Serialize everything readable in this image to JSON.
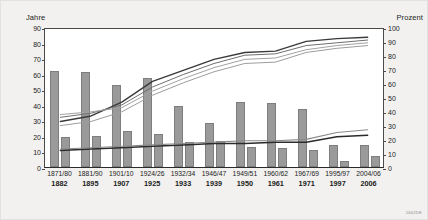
{
  "figure": {
    "background": "#f2f1ef",
    "plot_background": "#ffffff",
    "source_code": "1662DE"
  },
  "axes": {
    "left_caption": "Jahre",
    "right_caption": "Prozent",
    "left_ticks": [
      "90",
      "80",
      "70",
      "60",
      "50",
      "40",
      "30",
      "20",
      "10",
      "0"
    ],
    "right_ticks": [
      "100",
      "90",
      "80",
      "70",
      "60",
      "50",
      "40",
      "30",
      "20",
      "10",
      "0"
    ],
    "left_range": [
      0,
      90
    ],
    "right_range": [
      0,
      100
    ]
  },
  "chart_data": {
    "type": "bar",
    "title": "",
    "subtitle": "",
    "xlabel": "",
    "ylabel": "Jahre",
    "y2label": "Prozent",
    "ylim": [
      0,
      90
    ],
    "y2lim": [
      0,
      100
    ],
    "grid": false,
    "legend": "none",
    "categories": [
      "1871/80\n1882",
      "1881/90\n1895",
      "1901/10\n1907",
      "1924/26\n1925",
      "1932/34\n1933",
      "1946/47\n1939",
      "1949/51\n1950",
      "1960/62\n1961",
      "1967/69\n1971",
      "1995/97\n1997",
      "2004/06\n2006"
    ],
    "category_periods": [
      "1871/80",
      "1881/90",
      "1901/10",
      "1924/26",
      "1932/34",
      "1946/47",
      "1949/51",
      "1960/62",
      "1967/69",
      "1995/97",
      "2004/06"
    ],
    "category_years": [
      "1882",
      "1895",
      "1907",
      "1925",
      "1933",
      "1939",
      "1950",
      "1961",
      "1971",
      "1997",
      "2006"
    ],
    "bar_series": [
      {
        "name": "Saeule A (Jahre)",
        "axis": "left",
        "color": "#9a9a9a",
        "values": [
          62,
          61,
          53,
          57,
          39,
          28,
          42,
          41,
          37,
          14,
          14
        ]
      },
      {
        "name": "Saeule B (Jahre)",
        "axis": "left",
        "color": "#9a9a9a",
        "values": [
          19,
          20,
          23,
          21,
          16,
          17,
          13,
          12,
          11,
          4,
          7
        ]
      }
    ],
    "line_series": [
      {
        "name": "Linie 1 (Prozent)",
        "axis": "right",
        "color": "#3a3a3a",
        "width": 1.4,
        "values": [
          33,
          37,
          47,
          62,
          70,
          78,
          83,
          84,
          91,
          93,
          94
        ]
      },
      {
        "name": "Linie 2 (Prozent)",
        "axis": "right",
        "color": "#6f6f6f",
        "width": 1.0,
        "values": [
          36,
          39,
          45,
          58,
          67,
          75,
          81,
          82,
          88,
          90,
          92
        ]
      },
      {
        "name": "Linie 3 (Prozent)",
        "axis": "right",
        "color": "#a2a2a2",
        "width": 1.0,
        "values": [
          38,
          40,
          43,
          55,
          64,
          72,
          78,
          79,
          85,
          88,
          90
        ]
      },
      {
        "name": "Linie 4 (Prozent)",
        "axis": "right",
        "color": "#9d9d9d",
        "width": 1.0,
        "values": [
          30,
          33,
          40,
          52,
          61,
          69,
          75,
          76,
          83,
          86,
          88
        ]
      },
      {
        "name": "Linie 5 (Prozent unten)",
        "axis": "right",
        "color": "#2b2b2b",
        "width": 1.5,
        "values": [
          12,
          13,
          14,
          15,
          16,
          17,
          17,
          18,
          18,
          22,
          23
        ]
      },
      {
        "name": "Linie 6 (Prozent unten)",
        "axis": "right",
        "color": "#8a8a8a",
        "width": 1.1,
        "values": [
          13,
          14,
          15,
          16,
          17,
          18,
          19,
          19,
          20,
          25,
          27
        ]
      }
    ]
  }
}
